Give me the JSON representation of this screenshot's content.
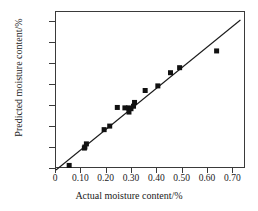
{
  "chart_data": {
    "type": "scatter",
    "title": "",
    "xlabel": "Actual moisture content/%",
    "ylabel": "Predicted moisture content/%",
    "xlim": [
      0.0,
      0.75
    ],
    "ylim": [
      0.0,
      0.75
    ],
    "xticks": [
      0,
      0.1,
      0.2,
      0.3,
      0.4,
      0.5,
      0.6,
      0.7
    ],
    "yticks": [
      0,
      0.1,
      0.2,
      0.3,
      0.4,
      0.5,
      0.6,
      0.7
    ],
    "xtick_labels": [
      "0",
      "0.10",
      "0.20",
      "0.30",
      "0.40",
      "0.50",
      "0.60",
      "0.70"
    ],
    "ytick_labels": [
      "0",
      "0.10",
      "0.20",
      "0.30",
      "0.40",
      "0.50",
      "0.60",
      "0.70"
    ],
    "grid": false,
    "legend": false,
    "marker": "square",
    "marker_color": "#111111",
    "marker_size": 5,
    "line_color": "#1a1a1a",
    "series": [
      {
        "name": "samples",
        "type": "scatter",
        "points": [
          {
            "x": 0.052,
            "y": 0.017
          },
          {
            "x": 0.112,
            "y": 0.1
          },
          {
            "x": 0.114,
            "y": 0.105
          },
          {
            "x": 0.12,
            "y": 0.12
          },
          {
            "x": 0.19,
            "y": 0.188
          },
          {
            "x": 0.212,
            "y": 0.205
          },
          {
            "x": 0.242,
            "y": 0.294
          },
          {
            "x": 0.272,
            "y": 0.292
          },
          {
            "x": 0.286,
            "y": 0.292
          },
          {
            "x": 0.288,
            "y": 0.272
          },
          {
            "x": 0.296,
            "y": 0.288
          },
          {
            "x": 0.306,
            "y": 0.3
          },
          {
            "x": 0.31,
            "y": 0.318
          },
          {
            "x": 0.352,
            "y": 0.375
          },
          {
            "x": 0.402,
            "y": 0.397
          },
          {
            "x": 0.452,
            "y": 0.46
          },
          {
            "x": 0.488,
            "y": 0.484
          },
          {
            "x": 0.634,
            "y": 0.564
          }
        ]
      },
      {
        "name": "fit-line",
        "type": "line",
        "x_start": 0.0,
        "y_start": -0.005,
        "x_end": 0.728,
        "y_end": 0.712
      }
    ]
  }
}
